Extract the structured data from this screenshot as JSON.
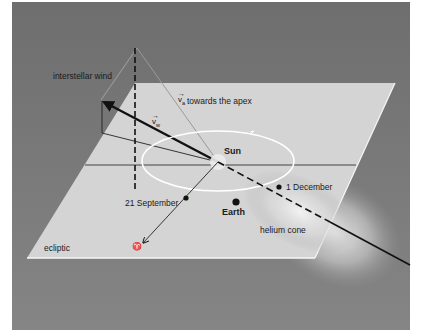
{
  "figure": {
    "type": "diagram",
    "colors": {
      "background_panel": "#7a7a7a",
      "ecliptic_plane": "#d6d6d6",
      "orbit": "#ffffff",
      "lines": "#111111",
      "helium_cone_glow": "#f2f2f2"
    },
    "labels": {
      "interstellar_wind": "interstellar wind",
      "v_apex_symbol": "v",
      "v_apex_subscript": "a",
      "v_apex_text": "towards the apex",
      "v_wind_symbol": "v",
      "v_wind_subscript": "w",
      "sun": "Sun",
      "earth": "Earth",
      "date_sep": "21 September",
      "date_dec": "1 December",
      "helium_cone": "helium cone",
      "ecliptic": "ecliptic",
      "vernal_equinox_symbol": "♈"
    },
    "vector_arrow_glyph": "→",
    "elements": [
      "ecliptic plane",
      "Earth orbit",
      "Sun",
      "Earth",
      "interstellar wind vector",
      "apex direction cone",
      "helium cone axis",
      "vernal equinox direction"
    ]
  }
}
